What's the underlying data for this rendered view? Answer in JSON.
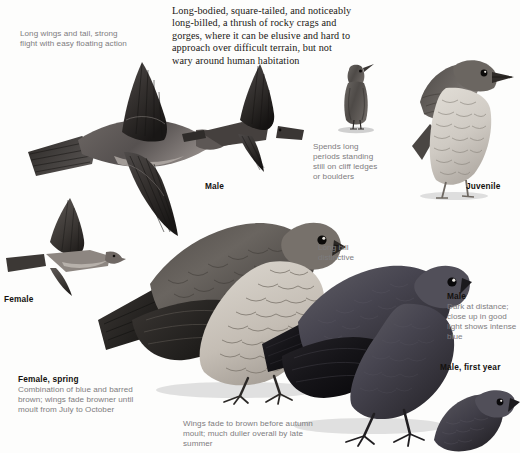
{
  "page": {
    "background_color": "#fdfdfc",
    "text_color": "#191613",
    "caption_color": "#7d7c7e",
    "label_color": "#14110f"
  },
  "intro": {
    "text": "Long-bodied, square-tailed, and noticeably long-billed, a thrush of rocky crags and gorges, where it can be elusive and hard to approach over difficult terrain, but not wary around human habitation"
  },
  "captions": {
    "flight": "Long wings and tail, strong flight with easy floating action",
    "standing": "Spends long periods standing still on cliff ledges or boulders",
    "bill": "Long bill distinctive",
    "wings_fade": "Wings fade to brown before autumn moult; much duller overall by late summer"
  },
  "labels": {
    "male_flight": "Male",
    "female_flight": "Female",
    "juvenile": "Juvenile",
    "male_first_year": "Male, first year"
  },
  "cap_blocks": {
    "male": {
      "title": "Male",
      "body": "Dark at distance; close up in good light shows intense blue"
    },
    "female_spring": {
      "title": "Female, spring",
      "body": "Combination of blue and barred brown; wings fade browner until moult from July to October"
    }
  },
  "illustrations": [
    {
      "name": "male-in-flight-large",
      "label": "Male"
    },
    {
      "name": "male-in-flight-small",
      "label": "Male"
    },
    {
      "name": "female-in-flight",
      "label": "Female"
    },
    {
      "name": "standing-bird-frontal",
      "label": "Spends long periods standing still"
    },
    {
      "name": "juvenile-perched",
      "label": "Juvenile"
    },
    {
      "name": "female-spring-perched",
      "label": "Female, spring"
    },
    {
      "name": "male-perched",
      "label": "Male"
    },
    {
      "name": "male-first-year-perched",
      "label": "Male, first year"
    }
  ]
}
